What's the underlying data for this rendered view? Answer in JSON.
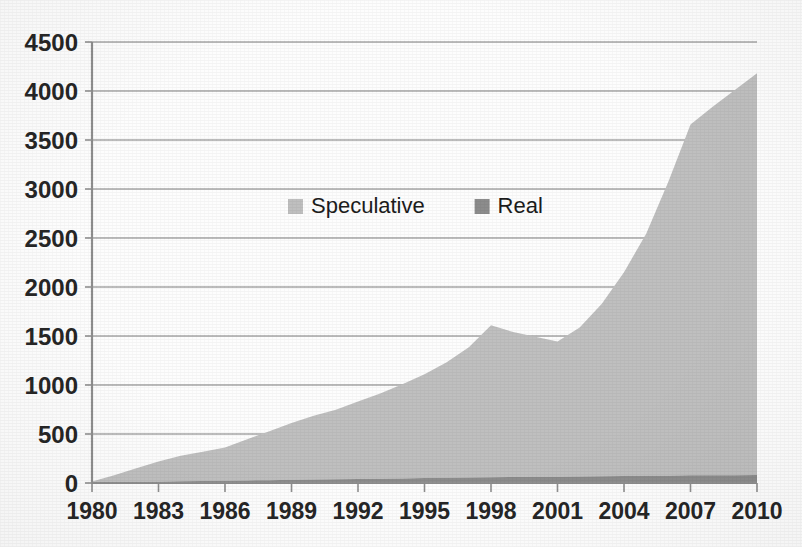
{
  "chart_data": {
    "type": "area",
    "stacked": true,
    "title": "",
    "subtitle": "",
    "xlabel": "",
    "ylabel": "",
    "xlim": [
      1980,
      2010
    ],
    "ylim": [
      0,
      4500
    ],
    "grid": true,
    "grid_axis": "y",
    "legend_position": "inside-upper-center",
    "x": [
      1980,
      1981,
      1982,
      1983,
      1984,
      1985,
      1986,
      1987,
      1988,
      1989,
      1990,
      1991,
      1992,
      1993,
      1994,
      1995,
      1996,
      1997,
      1998,
      1999,
      2000,
      2001,
      2002,
      2003,
      2004,
      2005,
      2006,
      2007,
      2008,
      2009,
      2010
    ],
    "x_tick_labels": [
      "1980",
      "1983",
      "1986",
      "1989",
      "1992",
      "1995",
      "1998",
      "2001",
      "2004",
      "2007",
      "2010"
    ],
    "y_tick_labels": [
      "0",
      "500",
      "1000",
      "1500",
      "2000",
      "2500",
      "3000",
      "3500",
      "4000",
      "4500"
    ],
    "y_ticks": [
      0,
      500,
      1000,
      1500,
      2000,
      2500,
      3000,
      3500,
      4000,
      4500
    ],
    "series": [
      {
        "name": "Speculative",
        "color": "#bfbfbf",
        "values": [
          10,
          70,
          140,
          205,
          260,
          300,
          340,
          420,
          500,
          580,
          650,
          710,
          790,
          870,
          960,
          1060,
          1180,
          1330,
          1550,
          1480,
          1430,
          1380,
          1520,
          1760,
          2080,
          2470,
          3000,
          3580,
          3760,
          3930,
          4100
        ]
      },
      {
        "name": "Real",
        "color": "#8c8c8c",
        "values": [
          5,
          8,
          11,
          14,
          17,
          20,
          23,
          26,
          29,
          32,
          35,
          38,
          41,
          44,
          47,
          50,
          53,
          56,
          59,
          61,
          63,
          65,
          67,
          69,
          71,
          73,
          75,
          78,
          79,
          80,
          82
        ]
      }
    ]
  },
  "legend": {
    "items": [
      {
        "label": "Speculative",
        "color": "#bfbfbf"
      },
      {
        "label": "Real",
        "color": "#8c8c8c"
      }
    ]
  },
  "axes": {
    "y_labels": [
      "4500",
      "4000",
      "3500",
      "3000",
      "2500",
      "2000",
      "1500",
      "1000",
      "500",
      "0"
    ],
    "x_labels": [
      "1980",
      "1983",
      "1986",
      "1989",
      "1992",
      "1995",
      "1998",
      "2001",
      "2004",
      "2007",
      "2010"
    ]
  },
  "colors": {
    "speculative": "#bfbfbf",
    "real": "#8c8c8c",
    "gridline": "#a6a6a6",
    "axis": "#8f8f8f",
    "text": "#262626",
    "background": "#fdfdfd"
  }
}
